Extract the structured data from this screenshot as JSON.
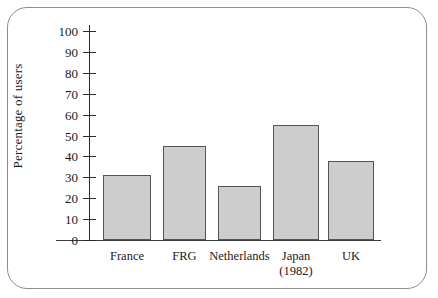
{
  "figure": {
    "frame_border_color": "#8d8d8d",
    "background": "#ffffff"
  },
  "chart_data": {
    "type": "bar",
    "title": "",
    "xlabel": "",
    "ylabel": "Percentage of users",
    "categories": [
      "France",
      "FRG",
      "Netherlands",
      "Japan",
      "UK"
    ],
    "category_sublabels": [
      "",
      "",
      "",
      "(1982)",
      ""
    ],
    "values": [
      31,
      45,
      26,
      55,
      38
    ],
    "ylim": [
      0,
      100
    ],
    "ytick_labels": [
      "0",
      "10",
      "20",
      "30",
      "40",
      "50",
      "60",
      "70",
      "80",
      "90",
      "100"
    ],
    "ytick_values": [
      0,
      10,
      20,
      30,
      40,
      50,
      60,
      70,
      80,
      90,
      100
    ],
    "grid": false,
    "legend": null,
    "bar_fill_color": "#cdcdcd",
    "bar_edge_color": "#555555",
    "axis_color": "#2a2a2a"
  }
}
